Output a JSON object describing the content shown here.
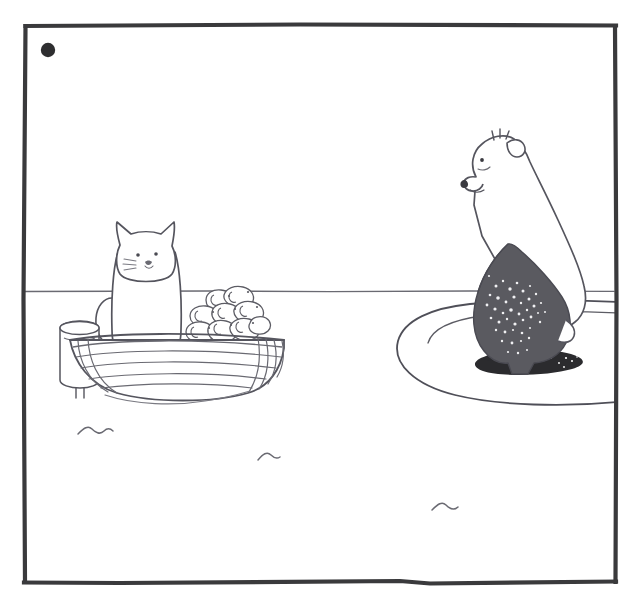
{
  "artwork": {
    "title": "Cat in Boat and Polar Bear on Ice Floe",
    "medium": "pen-and-ink line drawing",
    "style": "minimal hand-drawn cartoon panel",
    "background_color": "#ffffff",
    "ink_color": "#4a4a52",
    "frame": {
      "name": "hand-drawn-panel-border",
      "color": "#3a3a3c",
      "stroke_width": 4,
      "left": 24,
      "top": 25,
      "right": 615,
      "bottom": 582
    },
    "palette": {
      "ink": "#54545c",
      "ink_dark": "#3a3a3c",
      "frame": "#3a3a3c",
      "sun_dot": "#2e2e30",
      "bear_wet_fur": "#5a5a60",
      "bear_shadow": "#2b2b2e",
      "white": "#ffffff",
      "speckle": "#f2f2f2"
    },
    "horizon": {
      "name": "horizon-line",
      "y": 291,
      "x_start": 25,
      "x_end": 614
    },
    "elements": [
      {
        "id": "sun-dot",
        "label": "Sun",
        "shape": "filled-circle",
        "cx": 48,
        "cy": 50,
        "r": 7,
        "fill": "#2e2e30"
      },
      {
        "id": "cat",
        "label": "Cat",
        "description": "White cat with pointed ears sitting upright in a wooden rowboat, facing the viewer",
        "face": {
          "eyes": 2,
          "whisker_lines": 3,
          "nose": "small-v",
          "ears": 2
        },
        "bbox": [
          95,
          222,
          185,
          345
        ]
      },
      {
        "id": "boat",
        "label": "Rowboat",
        "description": "Wooden clinker-built rowboat with horizontal plank lines and vertical ribs at the stern",
        "plank_lines": 5,
        "rib_lines": 6,
        "bbox": [
          60,
          330,
          290,
          400
        ]
      },
      {
        "id": "fish-pile",
        "label": "Pile of fish",
        "description": "Heap of caught fish stacked in the stern of the boat",
        "fish_count": 12,
        "bbox": [
          182,
          288,
          272,
          350
        ]
      },
      {
        "id": "bucket",
        "label": "Bucket",
        "description": "Cylindrical bucket beside the boat on the left",
        "bbox": [
          58,
          320,
          100,
          395
        ]
      },
      {
        "id": "bear",
        "label": "Polar bear",
        "description": "Polar bear sitting upright on an ice floe with wet dark-grey lower body speckled with water droplets, looking toward the cat",
        "wet_fur_color": "#5a5a60",
        "bbox": [
          455,
          130,
          600,
          375
        ]
      },
      {
        "id": "ice-floe",
        "label": "Ice floe",
        "description": "Flat elliptical sheet of ice the bear sits on",
        "bbox": [
          395,
          300,
          617,
          405
        ]
      },
      {
        "id": "bear-shadow",
        "label": "Bear shadow",
        "shape": "ellipse-blob",
        "fill": "#2b2b2e"
      },
      {
        "id": "waves",
        "label": "Water ripples",
        "count": 3,
        "positions": [
          [
            95,
            430
          ],
          [
            268,
            458
          ],
          [
            446,
            508
          ]
        ]
      }
    ]
  }
}
